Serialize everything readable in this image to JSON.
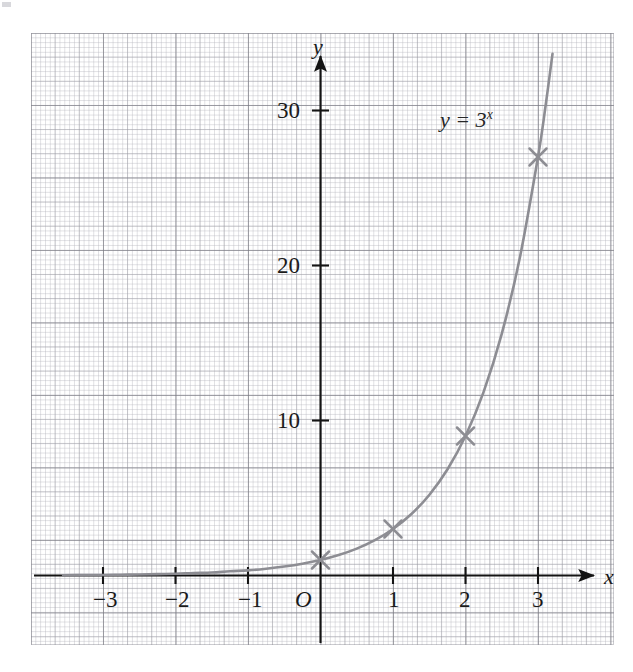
{
  "figure": {
    "kind": "math-graph",
    "background": "#ffffff",
    "grid": {
      "visible": true,
      "fine_color": "#b2b2ba",
      "medium_color": "#96969e",
      "heavy_color": "#787880",
      "small_cells_per_unit": 15,
      "medium_cells_per_unit": 3
    }
  },
  "axes": {
    "x_label": "x",
    "y_label": "y",
    "origin_label": "O",
    "axis_color": "#141414",
    "x_ticks": [
      "−3",
      "−2",
      "−1",
      "1",
      "2",
      "3"
    ],
    "x_tick_values": [
      -3,
      -2,
      -1,
      1,
      2,
      3
    ],
    "y_ticks": [
      "10",
      "20",
      "30"
    ],
    "y_tick_values": [
      10,
      20,
      30
    ],
    "xlim": [
      -4.0,
      4.05
    ],
    "ylim": [
      -2.4,
      33.9
    ],
    "arrow_x": true,
    "arrow_y": true
  },
  "chart_data": {
    "type": "line",
    "title": "",
    "subtitle": "",
    "xlabel": "x",
    "ylabel": "y",
    "xlim": [
      -4.0,
      4.05
    ],
    "ylim": [
      -2.4,
      33.9
    ],
    "grid": true,
    "legend": "none",
    "annotations": [
      {
        "text": "y = 3^x",
        "x": 1.75,
        "y": 29.0,
        "name": "curve-equation-label"
      }
    ],
    "series": [
      {
        "name": "y = 3^x",
        "equation": "y = 3^x",
        "color": "#8d8d93",
        "line_width": 2.6,
        "marker": "x-cross",
        "marker_color": "#8d8d93",
        "x": [
          -3.55,
          -3.3,
          -3.0,
          -2.75,
          -2.5,
          -2.25,
          -2.0,
          -1.75,
          -1.5,
          -1.25,
          -1.0,
          -0.75,
          -0.5,
          -0.25,
          0.0,
          0.25,
          0.5,
          0.75,
          1.0,
          1.25,
          1.5,
          1.75,
          2.0,
          2.25,
          2.5,
          2.75,
          3.0,
          3.1,
          3.2
        ],
        "y": [
          0.0172,
          0.0268,
          0.037,
          0.0527,
          0.0642,
          0.0913,
          0.1111,
          0.1581,
          0.1925,
          0.2738,
          0.3333,
          0.4387,
          0.5774,
          0.7598,
          1.0,
          1.3161,
          1.7321,
          2.2795,
          3.0,
          3.9482,
          5.1962,
          6.8385,
          9.0,
          11.8447,
          15.5885,
          20.5154,
          27.0,
          30.1444,
          33.6532
        ]
      }
    ],
    "marked_points": [
      {
        "label": "(0, 1)",
        "x": 0,
        "y": 1
      },
      {
        "label": "(1, 3)",
        "x": 1,
        "y": 3
      },
      {
        "label": "(2, 9)",
        "x": 2,
        "y": 9
      },
      {
        "label": "(3, 27)",
        "x": 3,
        "y": 27
      }
    ]
  }
}
